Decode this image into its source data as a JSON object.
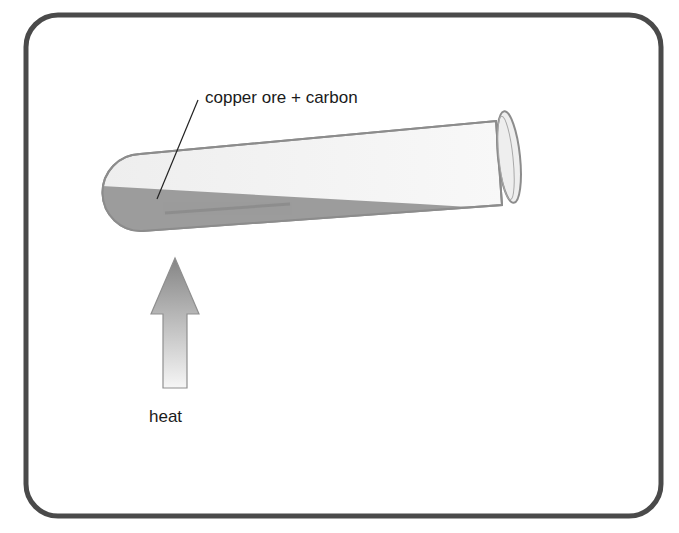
{
  "diagram": {
    "type": "experiment-apparatus",
    "labels": {
      "contents": "copper ore + carbon",
      "heat": "heat"
    },
    "components": [
      {
        "name": "test-tube",
        "orientation": "tilted, mouth raised to the right"
      },
      {
        "name": "powder-mixture",
        "description": "grey mixture in bottom of test tube"
      },
      {
        "name": "heat-arrow",
        "direction": "up",
        "points_to": "bottom of test tube"
      }
    ],
    "colors": {
      "frame": "#4a4a4a",
      "tube_outline": "#8c8c8c",
      "tube_fill": "#f2f2f2",
      "powder": "#9a9a9a",
      "arrow_top": "#8a8a8a",
      "arrow_bottom": "#f4f4f4",
      "text": "#1a1a1a"
    }
  }
}
